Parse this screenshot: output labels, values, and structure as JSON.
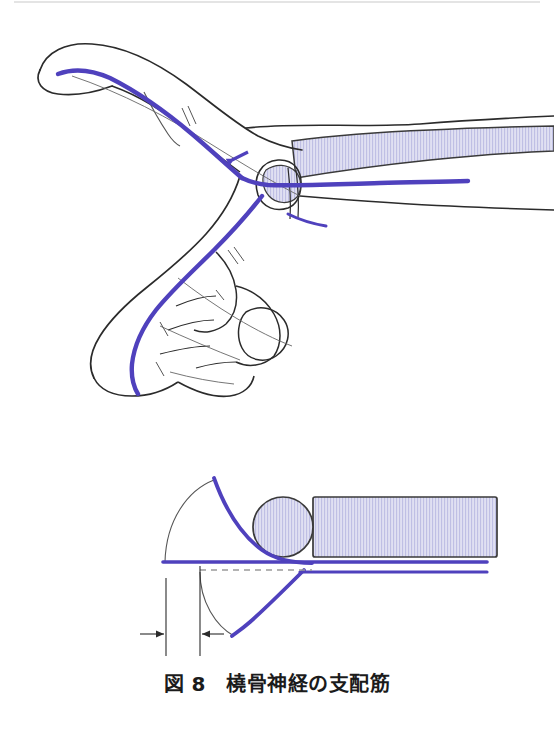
{
  "figure": {
    "caption": "図 8　橈骨神経の支配筋",
    "caption_label": "図 8",
    "caption_title": "橈骨神経の支配筋",
    "background_color": "#ffffff"
  },
  "colors": {
    "nerve_purple": "#4f41bd",
    "nerve_purple_light": "#7a6fd4",
    "outline_black": "#2b2b2b",
    "outline_thin": "#555555",
    "muscle_fill": "#dcdcf0",
    "muscle_hatch": "#b9b9e0",
    "muscle_border": "#3a3a3a",
    "dashed_gray": "#9a9a9a",
    "caption_text": "#1b1b1b",
    "scan_edge": "#e2e2e2"
  },
  "panels": [
    {
      "id": "upper-panel",
      "name": "hand-and-forearm-lateral-view",
      "description": "Lateral view of hand, wrist and forearm with radial nerve course",
      "elements": [
        {
          "name": "thumb-outline",
          "type": "outline"
        },
        {
          "name": "index-finger-outline",
          "type": "outline"
        },
        {
          "name": "middle-finger-outline",
          "type": "outline"
        },
        {
          "name": "ring-finger-outline",
          "type": "outline"
        },
        {
          "name": "little-finger-outline",
          "type": "outline"
        },
        {
          "name": "palm-outline",
          "type": "outline"
        },
        {
          "name": "wrist-outline",
          "type": "outline"
        },
        {
          "name": "forearm-outline",
          "type": "outline"
        },
        {
          "name": "radial-nerve-path",
          "type": "nerve",
          "color": "#4f41bd"
        },
        {
          "name": "nerve-direction-arrowhead",
          "type": "marker"
        },
        {
          "name": "muscle-band-forearm",
          "type": "muscle-hatched"
        },
        {
          "name": "muscle-band-wrist",
          "type": "muscle-hatched"
        },
        {
          "name": "tendon-line",
          "type": "thin-line"
        },
        {
          "name": "tendon-hatch-marks",
          "type": "marker"
        }
      ]
    },
    {
      "id": "lower-panel",
      "name": "schematic-cross-section",
      "description": "Schematic of bone cross-section with muscle band and nerve curves plus dimension markers",
      "elements": [
        {
          "name": "bone-circle",
          "type": "bone-cross-section"
        },
        {
          "name": "muscle-band-horizontal",
          "type": "muscle-hatched"
        },
        {
          "name": "nerve-baseline",
          "type": "nerve",
          "color": "#4f41bd"
        },
        {
          "name": "nerve-curve-upper",
          "type": "nerve",
          "color": "#4f41bd"
        },
        {
          "name": "nerve-curve-lower",
          "type": "nerve",
          "color": "#4f41bd"
        },
        {
          "name": "arc-upper",
          "type": "thin-arc"
        },
        {
          "name": "arc-lower",
          "type": "thin-arc"
        },
        {
          "name": "dashed-reference-line",
          "type": "dashed-line"
        },
        {
          "name": "dimension-leader-left",
          "type": "leader-line"
        },
        {
          "name": "dimension-leader-right",
          "type": "leader-line"
        },
        {
          "name": "dimension-arrow-left",
          "type": "arrow"
        },
        {
          "name": "dimension-arrow-right",
          "type": "arrow"
        }
      ]
    }
  ]
}
